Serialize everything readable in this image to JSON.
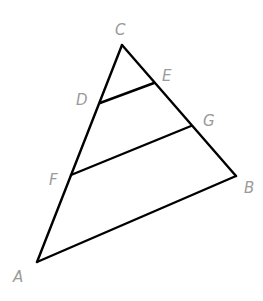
{
  "diagram": {
    "type": "triangle-with-parallel-segments",
    "stroke_color": "#000000",
    "label_color": "#9a9a9a",
    "points": {
      "A": {
        "x": 37,
        "y": 262
      },
      "B": {
        "x": 236,
        "y": 176
      },
      "C": {
        "x": 122,
        "y": 45
      },
      "D": {
        "x": 100,
        "y": 103
      },
      "E": {
        "x": 154,
        "y": 83
      },
      "F": {
        "x": 71,
        "y": 175
      },
      "G": {
        "x": 191,
        "y": 126
      }
    },
    "segments": [
      {
        "from": "A",
        "to": "C"
      },
      {
        "from": "C",
        "to": "B"
      },
      {
        "from": "B",
        "to": "A"
      },
      {
        "from": "D",
        "to": "E"
      },
      {
        "from": "F",
        "to": "G"
      }
    ],
    "labels": [
      {
        "text": "C",
        "x": 115,
        "y": 35
      },
      {
        "text": "E",
        "x": 162,
        "y": 81
      },
      {
        "text": "D",
        "x": 76,
        "y": 105
      },
      {
        "text": "G",
        "x": 203,
        "y": 126
      },
      {
        "text": "F",
        "x": 49,
        "y": 185
      },
      {
        "text": "B",
        "x": 244,
        "y": 193
      },
      {
        "text": "A",
        "x": 13,
        "y": 282
      }
    ]
  }
}
